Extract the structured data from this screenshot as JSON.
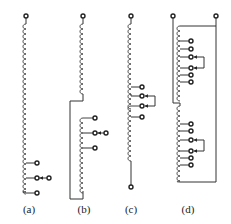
{
  "figure": {
    "panels": [
      {
        "id": "a",
        "label": "(a)",
        "label_x": 29,
        "description": "single winding with three taps at the lower end; middle tap connected to selector terminal"
      },
      {
        "id": "b",
        "label": "(b)",
        "label_x": 84,
        "description": "upper winding connected to a tapped lower winding at its mid-point section; three taps with selector on middle tap"
      },
      {
        "id": "c",
        "label": "(c)",
        "label_x": 131,
        "description": "winding with three mid taps and a reversing/bridging selector link between two taps; bottom terminal"
      },
      {
        "id": "d",
        "label": "(d)",
        "label_x": 188,
        "description": "two-terminal winding with two tapped sections each having arrowed selector link"
      }
    ]
  },
  "style": {
    "line_color": "#333333",
    "terminal_fill": "#ffffff",
    "background": "#ffffff"
  }
}
